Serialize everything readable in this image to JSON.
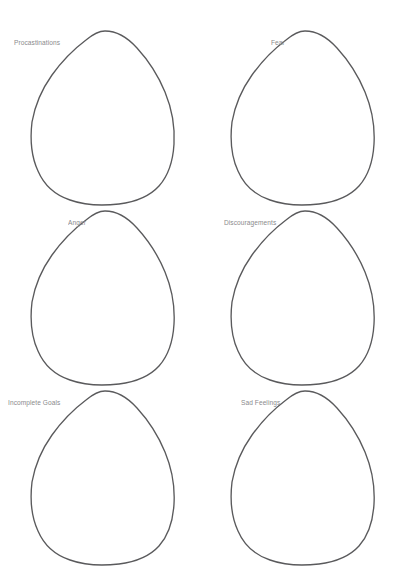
{
  "page": {
    "background_color": "#ffffff",
    "width": 400,
    "height": 588
  },
  "style": {
    "outline_color": "#5a5a5c",
    "label_color": "#8a8a8c",
    "outline_width": 1.35
  },
  "worksheet": {
    "columns": 2,
    "rows": 3,
    "shape_name": "blob-outline",
    "items": [
      {
        "label": "Procastinations",
        "shape": "blob-outline"
      },
      {
        "label": "Fear",
        "shape": "blob-outline"
      },
      {
        "label": "Anger",
        "shape": "blob-outline"
      },
      {
        "label": "Discouragements",
        "shape": "blob-outline"
      },
      {
        "label": "Incomplete Goals",
        "shape": "blob-outline"
      },
      {
        "label": "Sad Feelings",
        "shape": "blob-outline"
      }
    ]
  }
}
